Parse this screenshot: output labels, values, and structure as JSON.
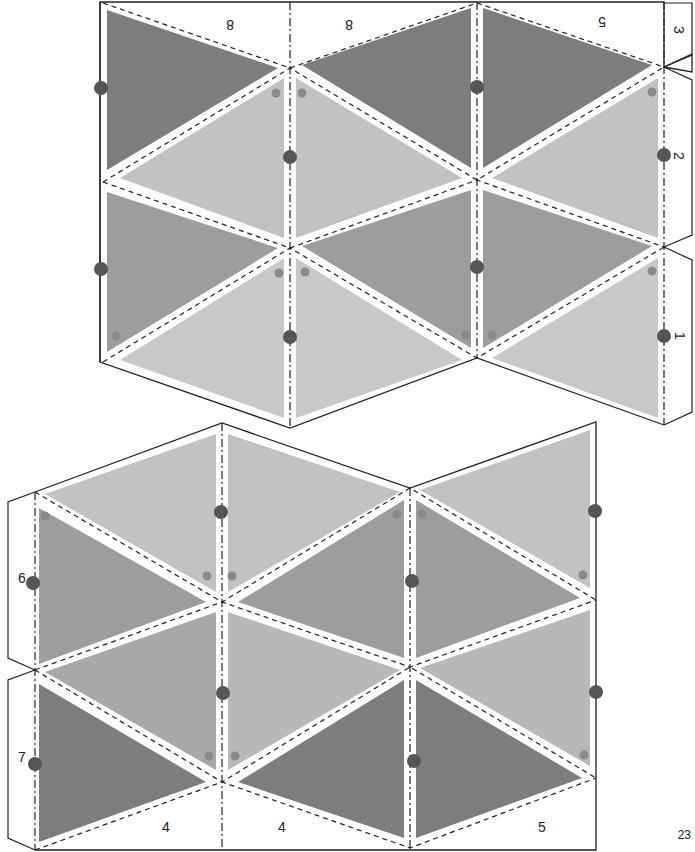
{
  "page_number": "23",
  "colors": {
    "dark": "#7d7d7d",
    "medium": "#9d9d9d",
    "light": "#c2c2c2",
    "dot_large": "#555555",
    "dot_small": "#8a8a8a",
    "outline": "#222222"
  },
  "top_piece": {
    "tab_labels": {
      "top_left": "8",
      "top_mid": "8",
      "top_right": "5",
      "side_3": "3",
      "side_2": "2",
      "side_1": "1"
    }
  },
  "bottom_piece": {
    "tab_labels": {
      "side_6": "6",
      "side_7": "7",
      "bottom_left": "4",
      "bottom_mid": "4",
      "bottom_right": "5"
    }
  }
}
